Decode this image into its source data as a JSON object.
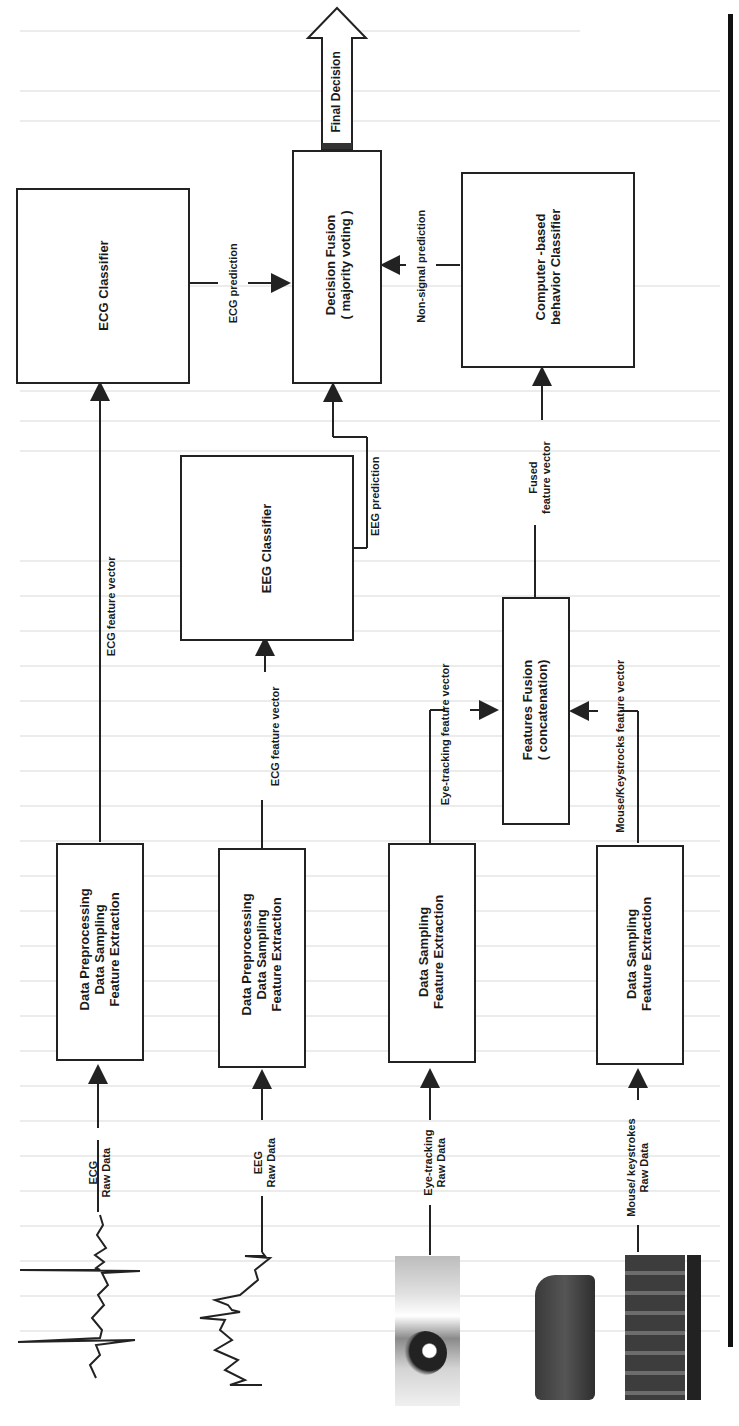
{
  "diagram": {
    "orientation": "rotated-90-ccw",
    "colors": {
      "line": "#222222",
      "background": "#ffffff",
      "ghost_text": "#ececec"
    },
    "outputs": {
      "final_decision": "Final Decision"
    },
    "fusion": {
      "decision_fusion": {
        "line1": "Decision Fusion",
        "line2": "( majority voting )"
      },
      "features_fusion": {
        "line1": "Features Fusion",
        "line2": "( concatenation)"
      }
    },
    "classifiers": {
      "ecg": "ECG Classifier",
      "eeg": "EEG Classifier",
      "behavior": {
        "line1": "Computer -based",
        "line2": "behavior Classifier"
      }
    },
    "processing": {
      "ecg": {
        "line1": "Data Preprocessing",
        "line2": "Data Sampling",
        "line3": "Feature Extraction"
      },
      "eeg": {
        "line1": "Data Preprocessing",
        "line2": "Data Sampling",
        "line3": "Feature Extraction"
      },
      "eye": {
        "line1": "Data Sampling",
        "line2": "Feature Extraction"
      },
      "mouse": {
        "line1": "Data Sampling",
        "line2": "Feature Extraction"
      }
    },
    "edge_labels": {
      "ecg_prediction": "ECG prediction",
      "eeg_prediction": "EEG prediction",
      "non_signal_prediction": "Non-signal prediction",
      "fused_vector_1": "Fused",
      "fused_vector_2": "feature vector",
      "ecg_feature_vector": "ECG feature vector",
      "eeg_feature_vector": "ECG feature vector",
      "eye_feature_vector": "Eye-tracking feature vector",
      "mouse_feature_vector": "Mouse/Keystrocks feature vector"
    },
    "inputs": {
      "ecg": {
        "line1": "ECG",
        "line2": "Raw Data",
        "icon": "ecg-waveform-icon"
      },
      "eeg": {
        "line1": "EEG",
        "line2": "Raw Data",
        "icon": "eeg-waveform-icon"
      },
      "eye": {
        "line1": "Eye-tracking",
        "line2": "Raw Data",
        "icon": "eye-photo-icon"
      },
      "mouse": {
        "line1": "Mouse/ keystrokes",
        "line2": "Raw Data",
        "icon": "keyboard-hands-photo-icon"
      }
    }
  }
}
